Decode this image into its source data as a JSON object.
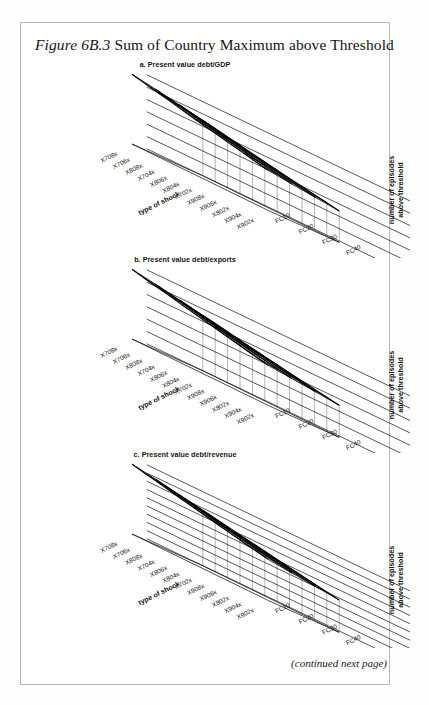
{
  "figure": {
    "lead": "Figure 6B.3",
    "title_rest": " Sum of Country Maximum above Threshold",
    "continued_note": "(continued next page)"
  },
  "axes": {
    "x_axis_label": "type of shock",
    "y_axis_label_line1": "number of episodes",
    "y_axis_label_line2": "above threshold",
    "shock_categories": [
      "X708x",
      "X706x",
      "X808x",
      "X704x",
      "X806x",
      "X804x",
      "X702x",
      "X908x",
      "X906x",
      "X802x",
      "X904x",
      "X902x"
    ],
    "fc_categories": [
      "FC10",
      "FC20",
      "FC30",
      "FC40"
    ]
  },
  "chart_data": [
    {
      "type": "line",
      "id": "a",
      "title": "a. Present value debt/GDP",
      "xlabel": "type of shock",
      "ylabel": "number of episodes above threshold",
      "ylim": [
        0,
        1200
      ],
      "yticks": [
        "0",
        "200",
        "400",
        "600",
        "800",
        "1,000",
        "1,200"
      ],
      "ytick_values": [
        0,
        200,
        400,
        600,
        800,
        1000,
        1200
      ],
      "grid": true,
      "categories": [
        "X708x",
        "X706x",
        "X808x",
        "X704x",
        "X806x",
        "X804x",
        "X702x",
        "X908x",
        "X906x",
        "X802x",
        "X904x",
        "X902x"
      ],
      "series": [
        {
          "name": "FC10",
          "values": [
            1130,
            1085,
            1040,
            1000,
            950,
            905,
            860,
            820,
            775,
            735,
            690,
            650
          ]
        },
        {
          "name": "FC20",
          "values": [
            1060,
            1015,
            975,
            930,
            885,
            845,
            800,
            760,
            715,
            680,
            640,
            600
          ]
        },
        {
          "name": "FC30",
          "values": [
            980,
            940,
            900,
            860,
            820,
            780,
            740,
            700,
            665,
            625,
            590,
            555
          ]
        },
        {
          "name": "FC40",
          "values": [
            900,
            865,
            825,
            790,
            750,
            715,
            680,
            645,
            610,
            575,
            545,
            510
          ]
        }
      ]
    },
    {
      "type": "line",
      "id": "b",
      "title": "b. Present value debt/exports",
      "xlabel": "type of shock",
      "ylabel": "number of episodes above threshold",
      "ylim": [
        0,
        6000
      ],
      "yticks": [
        "0",
        "1,000",
        "2,000",
        "3,000",
        "4,000",
        "5,000",
        "6,000"
      ],
      "ytick_values": [
        0,
        1000,
        2000,
        3000,
        4000,
        5000,
        6000
      ],
      "grid": true,
      "categories": [
        "X708x",
        "X706x",
        "X808x",
        "X704x",
        "X806x",
        "X804x",
        "X702x",
        "X908x",
        "X906x",
        "X802x",
        "X904x",
        "X902x"
      ],
      "series": [
        {
          "name": "FC10",
          "values": [
            5650,
            5420,
            5200,
            4990,
            4750,
            4530,
            4310,
            4100,
            3880,
            3670,
            3450,
            3250
          ]
        },
        {
          "name": "FC20",
          "values": [
            5300,
            5080,
            4870,
            4660,
            4440,
            4230,
            4020,
            3820,
            3620,
            3420,
            3220,
            3040
          ]
        },
        {
          "name": "FC30",
          "values": [
            4900,
            4700,
            4500,
            4310,
            4110,
            3920,
            3730,
            3540,
            3360,
            3180,
            3000,
            2830
          ]
        },
        {
          "name": "FC40",
          "values": [
            4500,
            4320,
            4140,
            3960,
            3780,
            3600,
            3430,
            3260,
            3090,
            2920,
            2760,
            2600
          ]
        }
      ]
    },
    {
      "type": "line",
      "id": "c",
      "title": "c. Present value debt/revenue",
      "xlabel": "type of shock",
      "ylabel": "number of episodes above threshold",
      "ylim": [
        0,
        4500
      ],
      "yticks": [
        "0",
        "500",
        "1,000",
        "1,500",
        "2,000",
        "2,500",
        "3,000",
        "3,500",
        "4,000",
        "4,500"
      ],
      "ytick_values": [
        0,
        500,
        1000,
        1500,
        2000,
        2500,
        3000,
        3500,
        4000,
        4500
      ],
      "grid": true,
      "categories": [
        "X708x",
        "X706x",
        "X808x",
        "X704x",
        "X806x",
        "X804x",
        "X702x",
        "X908x",
        "X906x",
        "X802x",
        "X904x",
        "X902x"
      ],
      "series": [
        {
          "name": "FC10",
          "values": [
            4250,
            4080,
            3920,
            3760,
            3590,
            3430,
            3270,
            3110,
            2950,
            2790,
            2640,
            2490
          ]
        },
        {
          "name": "FC20",
          "values": [
            3980,
            3820,
            3670,
            3510,
            3360,
            3200,
            3050,
            2900,
            2750,
            2600,
            2460,
            2320
          ]
        },
        {
          "name": "FC30",
          "values": [
            3680,
            3530,
            3390,
            3240,
            3100,
            2960,
            2820,
            2680,
            2540,
            2400,
            2270,
            2140
          ]
        },
        {
          "name": "FC40",
          "values": [
            3380,
            3250,
            3110,
            2980,
            2850,
            2720,
            2590,
            2460,
            2340,
            2210,
            2090,
            1970
          ]
        }
      ]
    }
  ]
}
